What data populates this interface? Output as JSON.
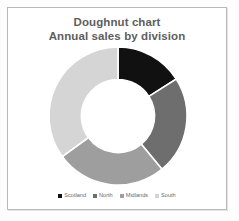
{
  "chart_data": {
    "type": "pie",
    "variant": "doughnut",
    "title": "Doughnut chart",
    "subtitle": "Annual sales by division",
    "xlabel": "",
    "ylabel": "",
    "grid": false,
    "legend_position": "bottom",
    "start_angle_deg": 0,
    "hole_ratio": 0.53,
    "categories": [
      "Scotland",
      "North",
      "Midlands",
      "South"
    ],
    "values": [
      16,
      23,
      26,
      35
    ],
    "percentages": [
      "16%",
      "23%",
      "26%",
      "35%"
    ],
    "slice_angles_deg": [
      57.6,
      82.8,
      93.6,
      126.0
    ],
    "colors": [
      "#111111",
      "#6e6e6e",
      "#9e9e9e",
      "#d5d5d5"
    ],
    "slices": [
      {
        "label": "Scotland",
        "value": 16,
        "color": "#111111",
        "start_deg": 0,
        "end_deg": 57.6
      },
      {
        "label": "North",
        "value": 23,
        "color": "#6e6e6e",
        "start_deg": 57.6,
        "end_deg": 140.4
      },
      {
        "label": "Midlands",
        "value": 26,
        "color": "#9e9e9e",
        "start_deg": 140.4,
        "end_deg": 234.0
      },
      {
        "label": "South",
        "value": 35,
        "color": "#d5d5d5",
        "start_deg": 234.0,
        "end_deg": 360.0
      }
    ]
  },
  "title": {
    "line1": "Doughnut chart",
    "line2": "Annual sales by division"
  },
  "legend": {
    "items": [
      {
        "label": "Scotland",
        "color": "#111111"
      },
      {
        "label": "North",
        "color": "#6e6e6e"
      },
      {
        "label": "Midlands",
        "color": "#9e9e9e"
      },
      {
        "label": "South",
        "color": "#d5d5d5"
      }
    ]
  },
  "style": {
    "frame_border": "#b9b9b9",
    "background": "#ffffff",
    "title_color": "#5e5e5e",
    "legend_text_color": "#6a6a6a",
    "slice_separator": "#ffffff"
  }
}
